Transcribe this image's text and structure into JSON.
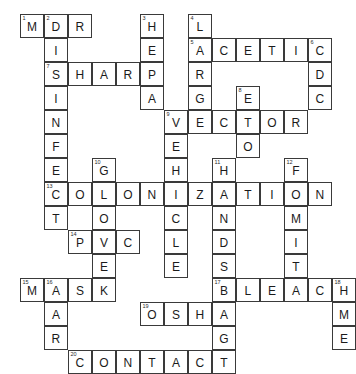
{
  "puzzle": {
    "type": "crossword-grid",
    "cols": 13,
    "rows": 12,
    "cell_px": 24,
    "origin_x": 20,
    "origin_y": 14,
    "ink_color": "#3a3a3a",
    "letter_color": "#1b1b1b",
    "background": "#ffffff",
    "cells": [
      {
        "c": 0,
        "r": 0,
        "letter": "M",
        "number": "1"
      },
      {
        "c": 1,
        "r": 0,
        "letter": "D",
        "number": "2"
      },
      {
        "c": 2,
        "r": 0,
        "letter": "R",
        "number": ""
      },
      {
        "c": 5,
        "r": 0,
        "letter": "H",
        "number": "3"
      },
      {
        "c": 7,
        "r": 0,
        "letter": "L",
        "number": "4"
      },
      {
        "c": 1,
        "r": 1,
        "letter": "I",
        "number": ""
      },
      {
        "c": 5,
        "r": 1,
        "letter": "E",
        "number": ""
      },
      {
        "c": 7,
        "r": 1,
        "letter": "A",
        "number": "5"
      },
      {
        "c": 8,
        "r": 1,
        "letter": "C",
        "number": ""
      },
      {
        "c": 9,
        "r": 1,
        "letter": "E",
        "number": ""
      },
      {
        "c": 10,
        "r": 1,
        "letter": "T",
        "number": ""
      },
      {
        "c": 11,
        "r": 1,
        "letter": "I",
        "number": ""
      },
      {
        "c": 12,
        "r": 1,
        "letter": "C",
        "number": "6"
      },
      {
        "c": 1,
        "r": 2,
        "letter": "S",
        "number": "7"
      },
      {
        "c": 2,
        "r": 2,
        "letter": "H",
        "number": ""
      },
      {
        "c": 3,
        "r": 2,
        "letter": "A",
        "number": ""
      },
      {
        "c": 4,
        "r": 2,
        "letter": "R",
        "number": ""
      },
      {
        "c": 5,
        "r": 2,
        "letter": "P",
        "number": ""
      },
      {
        "c": 7,
        "r": 2,
        "letter": "R",
        "number": ""
      },
      {
        "c": 12,
        "r": 2,
        "letter": "D",
        "number": ""
      },
      {
        "c": 1,
        "r": 3,
        "letter": "I",
        "number": ""
      },
      {
        "c": 5,
        "r": 3,
        "letter": "A",
        "number": ""
      },
      {
        "c": 7,
        "r": 3,
        "letter": "G",
        "number": ""
      },
      {
        "c": 9,
        "r": 3,
        "letter": "E",
        "number": "8"
      },
      {
        "c": 12,
        "r": 3,
        "letter": "C",
        "number": ""
      },
      {
        "c": 1,
        "r": 4,
        "letter": "N",
        "number": ""
      },
      {
        "c": 6,
        "r": 4,
        "letter": "V",
        "number": "9"
      },
      {
        "c": 7,
        "r": 4,
        "letter": "E",
        "number": ""
      },
      {
        "c": 8,
        "r": 4,
        "letter": "C",
        "number": ""
      },
      {
        "c": 9,
        "r": 4,
        "letter": "T",
        "number": ""
      },
      {
        "c": 10,
        "r": 4,
        "letter": "O",
        "number": ""
      },
      {
        "c": 11,
        "r": 4,
        "letter": "R",
        "number": ""
      },
      {
        "c": 1,
        "r": 5,
        "letter": "F",
        "number": ""
      },
      {
        "c": 6,
        "r": 5,
        "letter": "E",
        "number": ""
      },
      {
        "c": 9,
        "r": 5,
        "letter": "O",
        "number": ""
      },
      {
        "c": 1,
        "r": 6,
        "letter": "E",
        "number": ""
      },
      {
        "c": 3,
        "r": 6,
        "letter": "G",
        "number": "10"
      },
      {
        "c": 6,
        "r": 6,
        "letter": "H",
        "number": ""
      },
      {
        "c": 8,
        "r": 6,
        "letter": "H",
        "number": "11"
      },
      {
        "c": 11,
        "r": 6,
        "letter": "F",
        "number": "12"
      },
      {
        "c": 1,
        "r": 7,
        "letter": "C",
        "number": "13"
      },
      {
        "c": 2,
        "r": 7,
        "letter": "O",
        "number": ""
      },
      {
        "c": 3,
        "r": 7,
        "letter": "L",
        "number": ""
      },
      {
        "c": 4,
        "r": 7,
        "letter": "O",
        "number": ""
      },
      {
        "c": 5,
        "r": 7,
        "letter": "N",
        "number": ""
      },
      {
        "c": 6,
        "r": 7,
        "letter": "I",
        "number": ""
      },
      {
        "c": 7,
        "r": 7,
        "letter": "Z",
        "number": ""
      },
      {
        "c": 8,
        "r": 7,
        "letter": "A",
        "number": ""
      },
      {
        "c": 9,
        "r": 7,
        "letter": "T",
        "number": ""
      },
      {
        "c": 10,
        "r": 7,
        "letter": "I",
        "number": ""
      },
      {
        "c": 11,
        "r": 7,
        "letter": "O",
        "number": ""
      },
      {
        "c": 12,
        "r": 7,
        "letter": "N",
        "number": ""
      },
      {
        "c": 1,
        "r": 8,
        "letter": "T",
        "number": ""
      },
      {
        "c": 3,
        "r": 8,
        "letter": "O",
        "number": ""
      },
      {
        "c": 6,
        "r": 8,
        "letter": "C",
        "number": ""
      },
      {
        "c": 8,
        "r": 8,
        "letter": "N",
        "number": ""
      },
      {
        "c": 11,
        "r": 8,
        "letter": "M",
        "number": ""
      },
      {
        "c": 2,
        "r": 9,
        "letter": "P",
        "number": "14"
      },
      {
        "c": 3,
        "r": 9,
        "letter": "V",
        "number": ""
      },
      {
        "c": 4,
        "r": 9,
        "letter": "C",
        "number": ""
      },
      {
        "c": 6,
        "r": 9,
        "letter": "L",
        "number": ""
      },
      {
        "c": 8,
        "r": 9,
        "letter": "D",
        "number": ""
      },
      {
        "c": 11,
        "r": 9,
        "letter": "I",
        "number": ""
      },
      {
        "c": 3,
        "r": 10,
        "letter": "E",
        "number": ""
      },
      {
        "c": 6,
        "r": 10,
        "letter": "E",
        "number": ""
      },
      {
        "c": 8,
        "r": 10,
        "letter": "S",
        "number": ""
      },
      {
        "c": 11,
        "r": 10,
        "letter": "T",
        "number": ""
      },
      {
        "c": 0,
        "r": 11,
        "letter": "M",
        "number": "15"
      },
      {
        "c": 1,
        "r": 11,
        "letter": "A",
        "number": "16"
      },
      {
        "c": 2,
        "r": 11,
        "letter": "S",
        "number": ""
      },
      {
        "c": 3,
        "r": 11,
        "letter": "K",
        "number": ""
      },
      {
        "c": 8,
        "r": 11,
        "letter": "B",
        "number": "17"
      },
      {
        "c": 9,
        "r": 11,
        "letter": "L",
        "number": ""
      },
      {
        "c": 10,
        "r": 11,
        "letter": "E",
        "number": ""
      },
      {
        "c": 11,
        "r": 11,
        "letter": "A",
        "number": ""
      },
      {
        "c": 12,
        "r": 11,
        "letter": "C",
        "number": ""
      },
      {
        "c": 13,
        "r": 11,
        "letter": "H",
        "number": "18"
      },
      {
        "c": 1,
        "r": 12,
        "letter": "A",
        "number": ""
      },
      {
        "c": 5,
        "r": 12,
        "letter": "O",
        "number": "19"
      },
      {
        "c": 6,
        "r": 12,
        "letter": "S",
        "number": ""
      },
      {
        "c": 7,
        "r": 12,
        "letter": "H",
        "number": ""
      },
      {
        "c": 8,
        "r": 12,
        "letter": "A",
        "number": ""
      },
      {
        "c": 13,
        "r": 12,
        "letter": "M",
        "number": ""
      },
      {
        "c": 1,
        "r": 13,
        "letter": "R",
        "number": ""
      },
      {
        "c": 8,
        "r": 13,
        "letter": "G",
        "number": ""
      },
      {
        "c": 13,
        "r": 13,
        "letter": "E",
        "number": ""
      },
      {
        "c": 2,
        "r": 14,
        "letter": "C",
        "number": "20"
      },
      {
        "c": 3,
        "r": 14,
        "letter": "O",
        "number": ""
      },
      {
        "c": 4,
        "r": 14,
        "letter": "N",
        "number": ""
      },
      {
        "c": 5,
        "r": 14,
        "letter": "T",
        "number": ""
      },
      {
        "c": 6,
        "r": 14,
        "letter": "A",
        "number": ""
      },
      {
        "c": 7,
        "r": 14,
        "letter": "C",
        "number": ""
      },
      {
        "c": 8,
        "r": 14,
        "letter": "T",
        "number": ""
      }
    ],
    "entries_across": [
      {
        "number": "1",
        "answer": "MDR"
      },
      {
        "number": "5",
        "answer": "ACETIC"
      },
      {
        "number": "7",
        "answer": "SHARP"
      },
      {
        "number": "9",
        "answer": "VECTOR"
      },
      {
        "number": "13",
        "answer": "COLONIZATION"
      },
      {
        "number": "14",
        "answer": "PVC"
      },
      {
        "number": "15",
        "answer": "MASK"
      },
      {
        "number": "17",
        "answer": "BLEACH"
      },
      {
        "number": "19",
        "answer": "OSHA"
      },
      {
        "number": "20",
        "answer": "CONTACT"
      }
    ],
    "entries_down": [
      {
        "number": "2",
        "answer": "DISINFECT"
      },
      {
        "number": "3",
        "answer": "HEPA"
      },
      {
        "number": "4",
        "answer": "LARGE"
      },
      {
        "number": "6",
        "answer": "CDC"
      },
      {
        "number": "8",
        "answer": "ETO"
      },
      {
        "number": "9",
        "answer": "VEHICLES"
      },
      {
        "number": "10",
        "answer": "GLOVE"
      },
      {
        "number": "11",
        "answer": "HANDS"
      },
      {
        "number": "12",
        "answer": "FOMITE"
      },
      {
        "number": "16",
        "answer": "AARC"
      },
      {
        "number": "17",
        "answer": "BAG"
      },
      {
        "number": "18",
        "answer": "HME"
      }
    ]
  }
}
